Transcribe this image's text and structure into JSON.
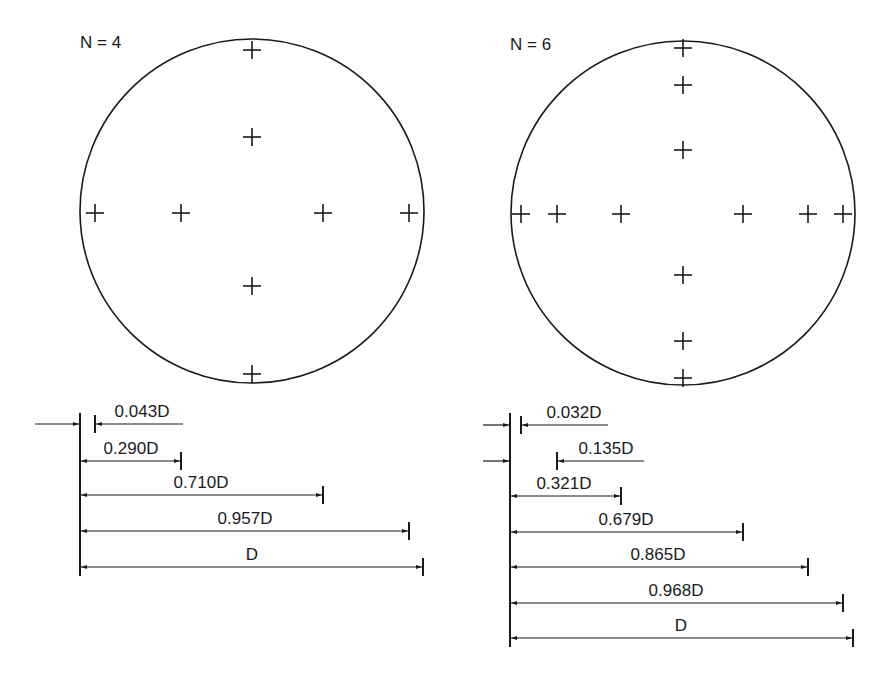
{
  "figure": {
    "colors": {
      "stroke": "#1a1a1a",
      "background": "#ffffff"
    },
    "panels": [
      {
        "id": "n4",
        "title": "N = 4",
        "title_pos": [
          80,
          34
        ],
        "circle": {
          "cx": 252,
          "cy": 211,
          "r": 172
        },
        "crosses": [
          {
            "x": 252,
            "y": 50
          },
          {
            "x": 252,
            "y": 137
          },
          {
            "x": 95,
            "y": 213
          },
          {
            "x": 181,
            "y": 213
          },
          {
            "x": 323,
            "y": 213
          },
          {
            "x": 409,
            "y": 213
          },
          {
            "x": 252,
            "y": 286
          },
          {
            "x": 252,
            "y": 374
          }
        ],
        "baseline": {
          "x": 80,
          "y1": 413,
          "y2": 576
        },
        "dimensions": [
          {
            "label": "0.043D",
            "value": 0.043,
            "type": "external",
            "y": 424,
            "tick_x": 95,
            "line_from": 183,
            "ext_from": 35,
            "label_x": 142
          },
          {
            "label": "0.290D",
            "value": 0.29,
            "type": "span",
            "y": 461,
            "tick_x": 181,
            "label_x": 131
          },
          {
            "label": "0.710D",
            "value": 0.71,
            "type": "span",
            "y": 495,
            "tick_x": 323,
            "label_x": 201
          },
          {
            "label": "0.957D",
            "value": 0.957,
            "type": "span",
            "y": 531,
            "tick_x": 409,
            "label_x": 245
          },
          {
            "label": "D",
            "value": 1.0,
            "type": "span",
            "y": 567,
            "tick_x": 423,
            "label_x": 252
          }
        ]
      },
      {
        "id": "n6",
        "title": "N = 6",
        "title_pos": [
          510,
          36
        ],
        "circle": {
          "cx": 683,
          "cy": 213,
          "r": 172
        },
        "crosses": [
          {
            "x": 683,
            "y": 48
          },
          {
            "x": 683,
            "y": 85
          },
          {
            "x": 683,
            "y": 150
          },
          {
            "x": 521,
            "y": 214
          },
          {
            "x": 557,
            "y": 214
          },
          {
            "x": 621,
            "y": 214
          },
          {
            "x": 743,
            "y": 214
          },
          {
            "x": 808,
            "y": 214
          },
          {
            "x": 843,
            "y": 214
          },
          {
            "x": 683,
            "y": 275
          },
          {
            "x": 683,
            "y": 341
          },
          {
            "x": 683,
            "y": 378
          }
        ],
        "baseline": {
          "x": 510,
          "y1": 413,
          "y2": 647
        },
        "dimensions": [
          {
            "label": "0.032D",
            "value": 0.032,
            "type": "external",
            "y": 425,
            "tick_x": 521,
            "line_from": 608,
            "ext_from": 483,
            "label_x": 574
          },
          {
            "label": "0.135D",
            "value": 0.135,
            "type": "external",
            "y": 461,
            "tick_x": 557,
            "line_from": 644,
            "ext_from": 483,
            "label_x": 606
          },
          {
            "label": "0.321D",
            "value": 0.321,
            "type": "span",
            "y": 496,
            "tick_x": 621,
            "label_x": 564
          },
          {
            "label": "0.679D",
            "value": 0.679,
            "type": "span",
            "y": 532,
            "tick_x": 743,
            "label_x": 626
          },
          {
            "label": "0.865D",
            "value": 0.865,
            "type": "span",
            "y": 567,
            "tick_x": 808,
            "label_x": 658
          },
          {
            "label": "0.968D",
            "value": 0.968,
            "type": "span",
            "y": 603,
            "tick_x": 843,
            "label_x": 676
          },
          {
            "label": "D",
            "value": 1.0,
            "type": "span",
            "y": 638,
            "tick_x": 853,
            "label_x": 681
          }
        ]
      }
    ]
  }
}
